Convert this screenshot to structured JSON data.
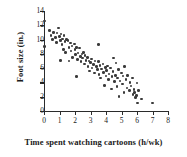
{
  "chart_data": {
    "type": "scatter",
    "title": "",
    "xlabel": "Time spent watching cartoons (h/wk)",
    "ylabel": "Foot size (in.)",
    "xlim": [
      0,
      8
    ],
    "ylim": [
      0,
      14
    ],
    "xticks": [
      0,
      1,
      2,
      3,
      4,
      5,
      6,
      7,
      8
    ],
    "yticks": [
      0,
      2,
      4,
      6,
      8,
      10,
      12,
      14
    ],
    "grid": false,
    "legend": null,
    "marker_color": "#3a3a3a",
    "axis_color": "#2b2b2b",
    "background": "#ffffff",
    "relationship": "negative linear association",
    "points": [
      [
        0.05,
        12.6
      ],
      [
        0.05,
        9.0
      ],
      [
        0.35,
        11.3
      ],
      [
        0.45,
        10.6
      ],
      [
        0.55,
        10.0
      ],
      [
        0.6,
        11.0
      ],
      [
        0.75,
        10.3
      ],
      [
        0.8,
        9.6
      ],
      [
        0.85,
        10.9
      ],
      [
        0.95,
        11.6
      ],
      [
        1.0,
        10.4
      ],
      [
        1.05,
        9.9
      ],
      [
        1.1,
        10.8
      ],
      [
        1.15,
        9.3
      ],
      [
        1.2,
        10.1
      ],
      [
        1.25,
        8.6
      ],
      [
        1.3,
        10.6
      ],
      [
        1.35,
        9.7
      ],
      [
        1.4,
        8.2
      ],
      [
        1.45,
        10.0
      ],
      [
        1.05,
        7.1
      ],
      [
        1.55,
        9.9
      ],
      [
        1.6,
        8.9
      ],
      [
        1.7,
        9.5
      ],
      [
        1.75,
        8.4
      ],
      [
        1.8,
        9.1
      ],
      [
        1.85,
        7.5
      ],
      [
        1.95,
        9.4
      ],
      [
        1.6,
        7.0
      ],
      [
        2.0,
        8.6
      ],
      [
        2.05,
        7.9
      ],
      [
        2.1,
        8.9
      ],
      [
        2.15,
        7.2
      ],
      [
        2.2,
        8.1
      ],
      [
        2.3,
        8.8
      ],
      [
        2.35,
        7.6
      ],
      [
        2.1,
        4.8
      ],
      [
        2.4,
        6.9
      ],
      [
        2.45,
        8.0
      ],
      [
        2.5,
        7.4
      ],
      [
        2.55,
        8.2
      ],
      [
        2.6,
        6.6
      ],
      [
        2.65,
        7.8
      ],
      [
        2.7,
        7.1
      ],
      [
        2.8,
        7.5
      ],
      [
        2.85,
        6.2
      ],
      [
        2.9,
        7.0
      ],
      [
        2.95,
        5.6
      ],
      [
        3.0,
        6.8
      ],
      [
        3.05,
        7.3
      ],
      [
        3.1,
        6.0
      ],
      [
        3.2,
        6.5
      ],
      [
        3.25,
        5.3
      ],
      [
        3.3,
        7.0
      ],
      [
        3.4,
        6.2
      ],
      [
        3.45,
        5.8
      ],
      [
        3.5,
        9.3
      ],
      [
        3.5,
        6.9
      ],
      [
        3.55,
        5.1
      ],
      [
        3.6,
        6.4
      ],
      [
        3.65,
        4.6
      ],
      [
        3.7,
        5.9
      ],
      [
        3.8,
        6.6
      ],
      [
        3.85,
        5.4
      ],
      [
        3.9,
        3.6
      ],
      [
        3.95,
        6.1
      ],
      [
        4.0,
        4.9
      ],
      [
        4.05,
        5.7
      ],
      [
        4.1,
        6.3
      ],
      [
        4.15,
        4.4
      ],
      [
        4.2,
        5.2
      ],
      [
        4.3,
        6.0
      ],
      [
        4.35,
        3.1
      ],
      [
        4.4,
        4.8
      ],
      [
        4.45,
        5.5
      ],
      [
        4.5,
        7.4
      ],
      [
        4.55,
        4.1
      ],
      [
        4.6,
        5.0
      ],
      [
        4.65,
        6.7
      ],
      [
        4.7,
        3.4
      ],
      [
        4.75,
        4.6
      ],
      [
        4.8,
        5.8
      ],
      [
        4.85,
        2.0
      ],
      [
        4.9,
        4.2
      ],
      [
        5.0,
        5.3
      ],
      [
        5.05,
        3.8
      ],
      [
        5.1,
        4.9
      ],
      [
        5.15,
        2.6
      ],
      [
        5.2,
        6.2
      ],
      [
        5.3,
        4.4
      ],
      [
        5.35,
        3.2
      ],
      [
        5.4,
        5.0
      ],
      [
        5.5,
        2.9
      ],
      [
        5.55,
        4.0
      ],
      [
        5.6,
        3.5
      ],
      [
        5.7,
        4.6
      ],
      [
        5.75,
        2.3
      ],
      [
        5.8,
        3.0
      ],
      [
        5.85,
        2.6
      ],
      [
        5.9,
        1.9
      ],
      [
        5.95,
        2.2
      ],
      [
        6.0,
        3.9
      ],
      [
        6.05,
        1.1
      ],
      [
        6.1,
        2.9
      ],
      [
        6.3,
        1.7
      ],
      [
        7.0,
        1.1
      ]
    ]
  }
}
